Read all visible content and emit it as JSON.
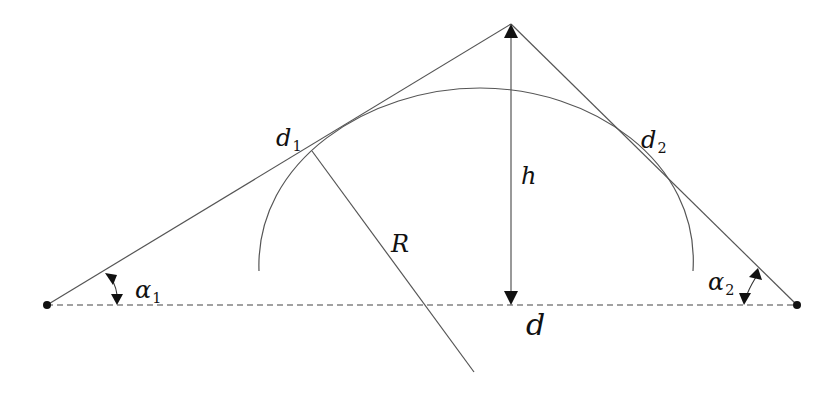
{
  "diagram": {
    "labels": {
      "d1": {
        "main": "d",
        "sub": "1"
      },
      "d2": {
        "main": "d",
        "sub": "2"
      },
      "h": {
        "main": "h"
      },
      "R": {
        "main": "R"
      },
      "d": {
        "main": "d"
      },
      "alpha1": {
        "main": "α",
        "sub": "1"
      },
      "alpha2": {
        "main": "α",
        "sub": "2"
      }
    },
    "colors": {
      "line": "#555555",
      "arrow": "#111111",
      "baseline": "#444444"
    }
  }
}
